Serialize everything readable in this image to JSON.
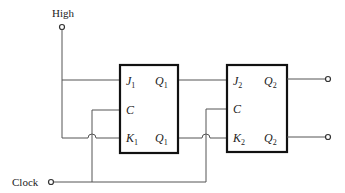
{
  "diagram": {
    "inputs": {
      "high_label": "High",
      "clock_label": "Clock"
    },
    "flipflops": [
      {
        "id": "FF1",
        "pins": {
          "j": "J",
          "j_sub": "1",
          "c": "C",
          "k": "K",
          "k_sub": "1",
          "q": "Q",
          "q_sub": "1",
          "qbar": "Q",
          "qbar_sub": "1"
        }
      },
      {
        "id": "FF2",
        "pins": {
          "j": "J",
          "j_sub": "2",
          "c": "C",
          "k": "K",
          "k_sub": "2",
          "q": "Q",
          "q_sub": "2",
          "qbar": "Q",
          "qbar_sub": "2"
        }
      }
    ],
    "outputs": [
      "Q2",
      "Q2-bar"
    ],
    "colors": {
      "wire": "#555555",
      "box": "#111111",
      "background": "#ffffff"
    }
  }
}
